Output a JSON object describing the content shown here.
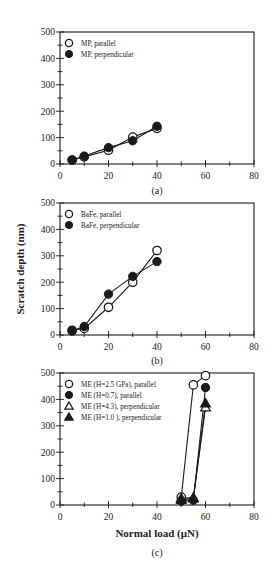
{
  "chart_data": [
    {
      "type": "line",
      "panel": "(a)",
      "title": "",
      "caption": "(a)",
      "xlabel": "",
      "ylabel": "",
      "xlim": [
        0,
        80
      ],
      "ylim": [
        0,
        500
      ],
      "xticks": [
        0,
        20,
        40,
        60,
        80
      ],
      "yticks": [
        0,
        100,
        200,
        300,
        400,
        500
      ],
      "grid": false,
      "legend_position": "upper left",
      "x": [
        5,
        10,
        20,
        30,
        40
      ],
      "series": [
        {
          "name": "MP, parallel",
          "marker": "open-circle",
          "values": [
            15,
            27,
            52,
            102,
            135
          ]
        },
        {
          "name": "MP, perpendicular",
          "marker": "filled-circle",
          "values": [
            15,
            30,
            62,
            88,
            143
          ]
        }
      ]
    },
    {
      "type": "line",
      "panel": "(b)",
      "title": "",
      "caption": "(b)",
      "xlabel": "",
      "ylabel": "Scratch depth (nm)",
      "xlim": [
        0,
        80
      ],
      "ylim": [
        0,
        500
      ],
      "xticks": [
        0,
        20,
        40,
        60,
        80
      ],
      "yticks": [
        0,
        100,
        200,
        300,
        400,
        500
      ],
      "grid": false,
      "legend_position": "upper left",
      "x": [
        5,
        10,
        20,
        30,
        40
      ],
      "series": [
        {
          "name": "BaFe, parallel",
          "marker": "open-circle",
          "values": [
            18,
            25,
            105,
            200,
            320
          ]
        },
        {
          "name": "BaFe, perpendicular",
          "marker": "filled-circle",
          "values": [
            15,
            32,
            155,
            222,
            278
          ]
        }
      ]
    },
    {
      "type": "line",
      "panel": "(c)",
      "title": "",
      "caption": "(c)",
      "xlabel": "Normal load (μN)",
      "ylabel": "",
      "xlim": [
        0,
        80
      ],
      "ylim": [
        0,
        500
      ],
      "xticks": [
        0,
        20,
        40,
        60,
        80
      ],
      "yticks": [
        0,
        100,
        200,
        300,
        400,
        500
      ],
      "grid": false,
      "legend_position": "upper left",
      "x": [
        50,
        55,
        60
      ],
      "series": [
        {
          "name": "ME (H=2.5 GPa), parallel",
          "marker": "open-circle",
          "values": [
            30,
            455,
            490
          ]
        },
        {
          "name": "ME (H=0.7), parallel",
          "marker": "filled-circle",
          "values": [
            15,
            18,
            445
          ]
        },
        {
          "name": "ME (H=4.3), perpendicular",
          "marker": "open-triangle",
          "values": [
            25,
            28,
            370
          ]
        },
        {
          "name": "ME (H=1.0 ), perpendicular",
          "marker": "filled-triangle",
          "values": [
            20,
            25,
            385
          ]
        }
      ]
    }
  ],
  "panels": {
    "a": {
      "caption": "(a)",
      "legend": [
        "MP, parallel",
        "MP, perpendicular"
      ],
      "yticks": [
        "0",
        "100",
        "200",
        "300",
        "400",
        "500"
      ],
      "xticks": [
        "0",
        "20",
        "40",
        "60",
        "80"
      ]
    },
    "b": {
      "caption": "(b)",
      "ylabel": "Scratch depth (nm)",
      "legend": [
        "BaFe, parallel",
        "BaFe, perpendicular"
      ],
      "yticks": [
        "0",
        "100",
        "200",
        "300",
        "400",
        "500"
      ],
      "xticks": [
        "0",
        "20",
        "40",
        "60",
        "80"
      ]
    },
    "c": {
      "caption": "(c)",
      "xlabel": "Normal load (μN)",
      "legend": [
        "ME (H=2.5 GPa), parallel",
        "ME (H=0.7), parallel",
        "ME (H=4.3), perpendicular",
        "ME (H=1.0 ), perpendicular"
      ],
      "yticks": [
        "0",
        "100",
        "200",
        "300",
        "400",
        "500"
      ],
      "xticks": [
        "0",
        "20",
        "40",
        "60",
        "80"
      ]
    }
  },
  "colors": {
    "ink": "#1a1a1a",
    "background": "#ffffff"
  }
}
